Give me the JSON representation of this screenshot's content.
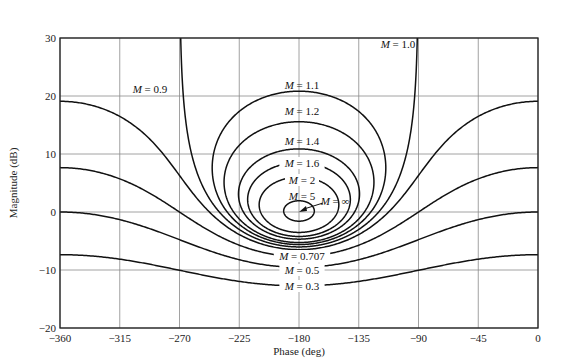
{
  "chart_data": {
    "type": "line",
    "title": "",
    "xlabel": "Phase (deg)",
    "ylabel": "Magnitude (dB)",
    "xlim": [
      -360,
      0
    ],
    "ylim": [
      -20,
      30
    ],
    "grid": true,
    "x_ticks": [
      -360,
      -315,
      -270,
      -225,
      -180,
      -135,
      -90,
      -45,
      0
    ],
    "x_tick_labels": [
      "−360",
      "−315",
      "−270",
      "−225",
      "−180",
      "−135",
      "−90",
      "−45",
      "0"
    ],
    "y_ticks": [
      -20,
      -10,
      0,
      10,
      20,
      30
    ],
    "y_tick_labels": [
      "−20",
      "−10",
      "0",
      "10",
      "20",
      "30"
    ],
    "series": [
      {
        "name": "M = 0.3",
        "M": 0.3,
        "label": "M = 0.3",
        "label_pos": [
          -180,
          -12.7
        ],
        "sample_points": [
          [
            -360,
            -7.4
          ],
          [
            -270,
            -10.3
          ],
          [
            -180,
            -12.7
          ],
          [
            -90,
            -10.3
          ],
          [
            0,
            -7.4
          ]
        ]
      },
      {
        "name": "M = 0.5",
        "M": 0.5,
        "label": "M = 0.5",
        "label_pos": [
          -180,
          -9.5
        ],
        "sample_points": [
          [
            -360,
            0.0
          ],
          [
            -270,
            -6.0
          ],
          [
            -180,
            -9.5
          ],
          [
            -90,
            -6.0
          ],
          [
            0,
            0.0
          ]
        ]
      },
      {
        "name": "M = 0.707",
        "M": 0.707,
        "label": "M = 0.707",
        "label_pos": [
          -180,
          -7.7
        ],
        "sample_points": [
          [
            -360,
            7.7
          ],
          [
            -270,
            0.0
          ],
          [
            -180,
            -7.7
          ],
          [
            -90,
            0.0
          ],
          [
            0,
            7.7
          ]
        ]
      },
      {
        "name": "M = 0.9",
        "M": 0.9,
        "label": "M = 0.9",
        "label_pos": [
          -318,
          21.5
        ],
        "sample_points": [
          [
            -360,
            19.1
          ],
          [
            -270,
            6.3
          ],
          [
            -180,
            -5.6
          ],
          [
            -90,
            6.3
          ],
          [
            0,
            19.1
          ]
        ]
      },
      {
        "name": "M = 1.0",
        "M": 1.0,
        "label": "M = 1.0",
        "label_pos": [
          -103,
          28
        ],
        "sample_points": [
          [
            -269.1,
            30
          ],
          [
            -240,
            0
          ],
          [
            -180,
            -6.0
          ],
          [
            -120,
            0
          ],
          [
            -90.9,
            30
          ]
        ]
      },
      {
        "name": "M = 1.1",
        "M": 1.1,
        "label": "M = 1.1",
        "label_pos": [
          -180,
          21.5
        ],
        "sample_points": [
          [
            -180,
            20.8
          ],
          [
            -180,
            -5.6
          ]
        ]
      },
      {
        "name": "M = 1.2",
        "M": 1.2,
        "label": "M = 1.2",
        "label_pos": [
          -180,
          16.7
        ],
        "sample_points": [
          [
            -180,
            15.6
          ],
          [
            -180,
            -5.3
          ]
        ]
      },
      {
        "name": "M = 1.4",
        "M": 1.4,
        "label": "M = 1.4",
        "label_pos": [
          -180,
          11.7
        ],
        "sample_points": [
          [
            -180,
            10.9
          ],
          [
            -180,
            -4.7
          ]
        ]
      },
      {
        "name": "M = 1.6",
        "M": 1.6,
        "label": "M = 1.6",
        "label_pos": [
          -180,
          8.2
        ],
        "sample_points": [
          [
            -180,
            8.5
          ],
          [
            -180,
            -4.2
          ]
        ]
      },
      {
        "name": "M = 2",
        "M": 2.0,
        "label": "M = 2",
        "label_pos": [
          -180,
          5.3
        ],
        "sample_points": [
          [
            -180,
            6.0
          ],
          [
            -180,
            -3.5
          ]
        ]
      },
      {
        "name": "M = 5",
        "M": 5.0,
        "label": "M = 5",
        "label_pos": [
          -180,
          2.6
        ],
        "sample_points": [
          [
            -180,
            1.9
          ],
          [
            -180,
            -1.6
          ]
        ]
      },
      {
        "name": "M = ∞",
        "M": "inf",
        "label": "M = ∞",
        "label_pos": [
          -157,
          1.8
        ],
        "sample_points": [
          [
            -180,
            0
          ]
        ]
      }
    ],
    "annotations": [
      {
        "text": "M = ∞",
        "arrow_to": [
          -180,
          0
        ]
      }
    ]
  },
  "labels": {
    "xlabel": "Phase (deg)",
    "ylabel": "Magnitude (dB)"
  }
}
